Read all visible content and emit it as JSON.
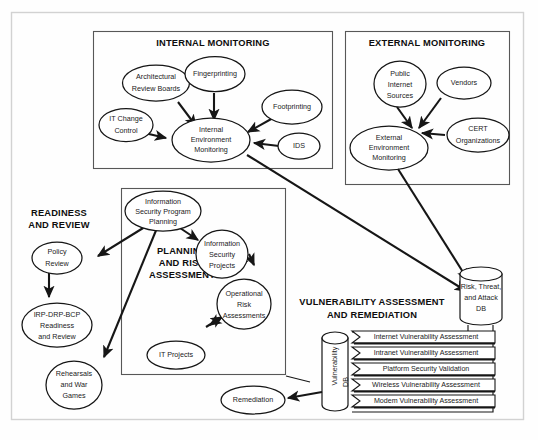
{
  "figure": {
    "frame_color": "#d2d2d2",
    "line_color": "#161616"
  },
  "sections": {
    "internal_monitoring": {
      "title": "INTERNAL MONITORING",
      "nodes": [
        {
          "id": "arb",
          "label_lines": [
            "Architectural",
            "Review Boards"
          ]
        },
        {
          "id": "fingerprinting",
          "label_lines": [
            "Fingerprinting"
          ]
        },
        {
          "id": "footprinting",
          "label_lines": [
            "Footprinting"
          ]
        },
        {
          "id": "itchange",
          "label_lines": [
            "IT Change",
            "Control"
          ]
        },
        {
          "id": "ids",
          "label_lines": [
            "IDS"
          ]
        },
        {
          "id": "iem",
          "label_lines": [
            "Internal",
            "Environment",
            "Monitoring"
          ]
        }
      ]
    },
    "external_monitoring": {
      "title": "EXTERNAL MONITORING",
      "nodes": [
        {
          "id": "public",
          "label_lines": [
            "Public",
            "Internet",
            "Sources"
          ]
        },
        {
          "id": "vendors",
          "label_lines": [
            "Vendors"
          ]
        },
        {
          "id": "cert",
          "label_lines": [
            "CERT",
            "Organizations"
          ]
        },
        {
          "id": "eem",
          "label_lines": [
            "External",
            "Environment",
            "Monitoring"
          ]
        }
      ]
    },
    "planning_and_risk": {
      "title_lines": [
        "PLANNING",
        "AND RISK",
        "ASSESSMENT"
      ],
      "nodes": [
        {
          "id": "ispp",
          "label_lines": [
            "Information",
            "Security Program",
            "Planning"
          ]
        },
        {
          "id": "isproj",
          "label_lines": [
            "Information",
            "Security",
            "Projects"
          ]
        },
        {
          "id": "ora",
          "label_lines": [
            "Operational",
            "Risk",
            "Assessments"
          ]
        },
        {
          "id": "itproj",
          "label_lines": [
            "IT Projects"
          ]
        }
      ]
    },
    "readiness_and_review": {
      "title_lines": [
        "READINESS",
        "AND REVIEW"
      ],
      "nodes": [
        {
          "id": "policy",
          "label_lines": [
            "Policy",
            "Review"
          ]
        },
        {
          "id": "irp",
          "label_lines": [
            "IRP-DRP-BCP",
            "Readiness",
            "and Review"
          ]
        },
        {
          "id": "rehearsals",
          "label_lines": [
            "Rehearsals",
            "and War",
            "Games"
          ]
        }
      ]
    },
    "vulnerability": {
      "title_lines": [
        "VULNERABILITY ASSESSMENT",
        "AND REMEDIATION"
      ],
      "nodes": [
        {
          "id": "remediation",
          "label_lines": [
            "Remediation"
          ]
        }
      ],
      "assessments": [
        "Internet Vulnerability Assessment",
        "Intranet Vulnerability Assessment",
        "Platform Security Validation",
        "Wireless Vulnerability Assessment",
        "Modem Vulnerability Assessment"
      ]
    }
  },
  "databases": [
    {
      "id": "risk_db",
      "label_lines": [
        "Risk, Threat,",
        "and Attack",
        "DB"
      ],
      "orientation": "horizontal"
    },
    {
      "id": "vuln_db",
      "label_lines": [
        "Vulnerability",
        "DB"
      ],
      "orientation": "vertical"
    }
  ]
}
